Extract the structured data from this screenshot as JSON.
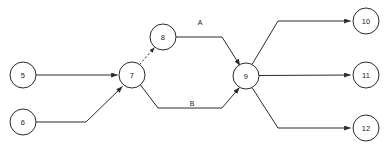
{
  "diagram": {
    "canvas": {
      "width": 391,
      "height": 153,
      "background": "#ffffff"
    },
    "style": {
      "stroke_color": "#2b2b2b",
      "node_fill": "#ffffff",
      "text_color": "#1a1a1a",
      "node_radius": 13
    },
    "nodes": [
      {
        "id": "n5",
        "label": "5",
        "cx": 23,
        "cy": 75,
        "r": 13
      },
      {
        "id": "n6",
        "label": "6",
        "cx": 23,
        "cy": 122,
        "r": 13
      },
      {
        "id": "n7",
        "label": "7",
        "cx": 132,
        "cy": 75,
        "r": 13
      },
      {
        "id": "n8",
        "label": "8",
        "cx": 163,
        "cy": 37,
        "r": 13
      },
      {
        "id": "n9",
        "label": "9",
        "cx": 246,
        "cy": 76,
        "r": 13
      },
      {
        "id": "n10",
        "label": "10",
        "cx": 366,
        "cy": 21,
        "r": 13
      },
      {
        "id": "n11",
        "label": "11",
        "cx": 366,
        "cy": 75,
        "r": 13
      },
      {
        "id": "n12",
        "label": "12",
        "cx": 366,
        "cy": 128,
        "r": 13
      }
    ],
    "edges": [
      {
        "id": "e5-7",
        "from": "5",
        "to": "7",
        "label": "",
        "arrow": true,
        "dashed": false
      },
      {
        "id": "e6-7",
        "from": "6",
        "to": "7",
        "label": "",
        "arrow": true,
        "dashed": false
      },
      {
        "id": "e7-8",
        "from": "7",
        "to": "8",
        "label": "",
        "arrow": true,
        "dashed": true
      },
      {
        "id": "e8-9",
        "from": "8",
        "to": "9",
        "label": "A",
        "arrow": true,
        "dashed": false
      },
      {
        "id": "e7-9",
        "from": "7",
        "to": "9",
        "label": "B",
        "arrow": true,
        "dashed": false
      },
      {
        "id": "e9-10",
        "from": "9",
        "to": "10",
        "label": "",
        "arrow": true,
        "dashed": false
      },
      {
        "id": "e9-11",
        "from": "9",
        "to": "11",
        "label": "",
        "arrow": true,
        "dashed": false
      },
      {
        "id": "e9-12",
        "from": "9",
        "to": "12",
        "label": "",
        "arrow": true,
        "dashed": false
      }
    ],
    "edge_labels": [
      {
        "id": "label-a",
        "text": "A",
        "x": 200,
        "y": 22
      },
      {
        "id": "label-b",
        "text": "B",
        "x": 192,
        "y": 103
      }
    ]
  }
}
